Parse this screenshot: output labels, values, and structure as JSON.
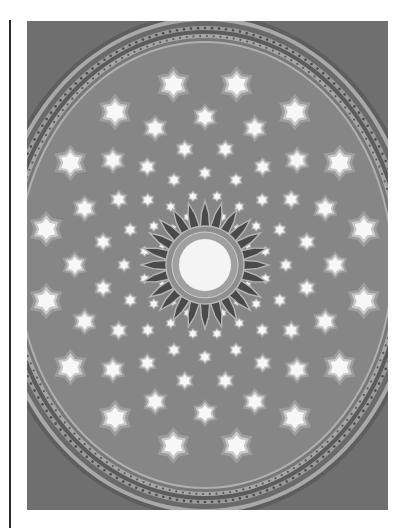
{
  "image": {
    "subject": "Dome ceiling with star-shaped skylights and central rosette oculus",
    "tone": "grayscale",
    "colors": {
      "page_bg": "#ffffff",
      "rule": "#2a2a2a",
      "spandrel": "#6f6f6f",
      "trim_dark": "#5e5e5e",
      "trim_light": "#a9a9a9",
      "dome": "#868686",
      "star_frame": "#a4a4a4",
      "star_glow": "#c8c8c8",
      "star_light": "#f7f7f7",
      "petal": "#4a4a4a",
      "petal_outline": "#b5b5b5",
      "ring": "#a0a0a0",
      "oculus": "#f4f4f4"
    },
    "dome": {
      "cx": 178,
      "cy": 244,
      "rx": 186,
      "ry": 222
    },
    "rosette": {
      "petals": 24,
      "oculus_r": 26,
      "ring_r": 38,
      "petal_r": 64
    },
    "star_rings": [
      {
        "radius": 52,
        "count": 16,
        "size": 3.0,
        "offset": 0
      },
      {
        "radius": 70,
        "count": 16,
        "size": 3.6,
        "offset": 0.5
      },
      {
        "radius": 92,
        "count": 16,
        "size": 4.6,
        "offset": 0
      },
      {
        "radius": 118,
        "count": 16,
        "size": 6.0,
        "offset": 0.5
      },
      {
        "radius": 148,
        "count": 16,
        "size": 8.0,
        "offset": 0
      },
      {
        "radius": 184,
        "count": 16,
        "size": 10.5,
        "offset": 0.5
      }
    ]
  }
}
